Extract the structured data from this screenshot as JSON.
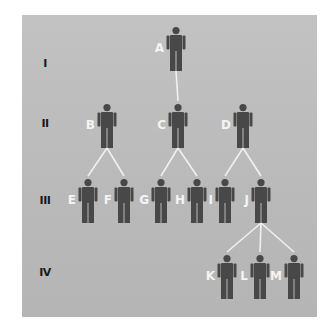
{
  "colors": {
    "background": "#bdbdbd",
    "figure": "#484848",
    "line": "#f0f0f0",
    "label": "#f4f4f4",
    "generation": "#1a1a1a"
  },
  "generations": [
    {
      "label": "I",
      "y": 63
    },
    {
      "label": "II",
      "y": 123
    },
    {
      "label": "III",
      "y": 200
    },
    {
      "label": "IV",
      "y": 272
    }
  ],
  "individuals": [
    {
      "id": "A",
      "generation": "I",
      "x": 176,
      "top": 27
    },
    {
      "id": "B",
      "generation": "II",
      "x": 107,
      "top": 104
    },
    {
      "id": "C",
      "generation": "II",
      "x": 178,
      "top": 104
    },
    {
      "id": "D",
      "generation": "II",
      "x": 243,
      "top": 104
    },
    {
      "id": "E",
      "generation": "III",
      "x": 88,
      "top": 179
    },
    {
      "id": "F",
      "generation": "III",
      "x": 124,
      "top": 179
    },
    {
      "id": "G",
      "generation": "III",
      "x": 161,
      "top": 179
    },
    {
      "id": "H",
      "generation": "III",
      "x": 197,
      "top": 179
    },
    {
      "id": "I",
      "generation": "III",
      "x": 225,
      "top": 179
    },
    {
      "id": "J",
      "generation": "III",
      "x": 261,
      "top": 179
    },
    {
      "id": "K",
      "generation": "IV",
      "x": 227,
      "top": 255
    },
    {
      "id": "L",
      "generation": "IV",
      "x": 260,
      "top": 255
    },
    {
      "id": "M",
      "generation": "IV",
      "x": 294,
      "top": 255
    }
  ],
  "connections": [
    {
      "from": "A",
      "to": [
        "C"
      ]
    },
    {
      "from": "B",
      "to": [
        "E",
        "F"
      ]
    },
    {
      "from": "C",
      "to": [
        "G",
        "H"
      ]
    },
    {
      "from": "D",
      "to": [
        "I",
        "J"
      ]
    },
    {
      "from": "J",
      "to": [
        "K",
        "L",
        "M"
      ]
    }
  ]
}
